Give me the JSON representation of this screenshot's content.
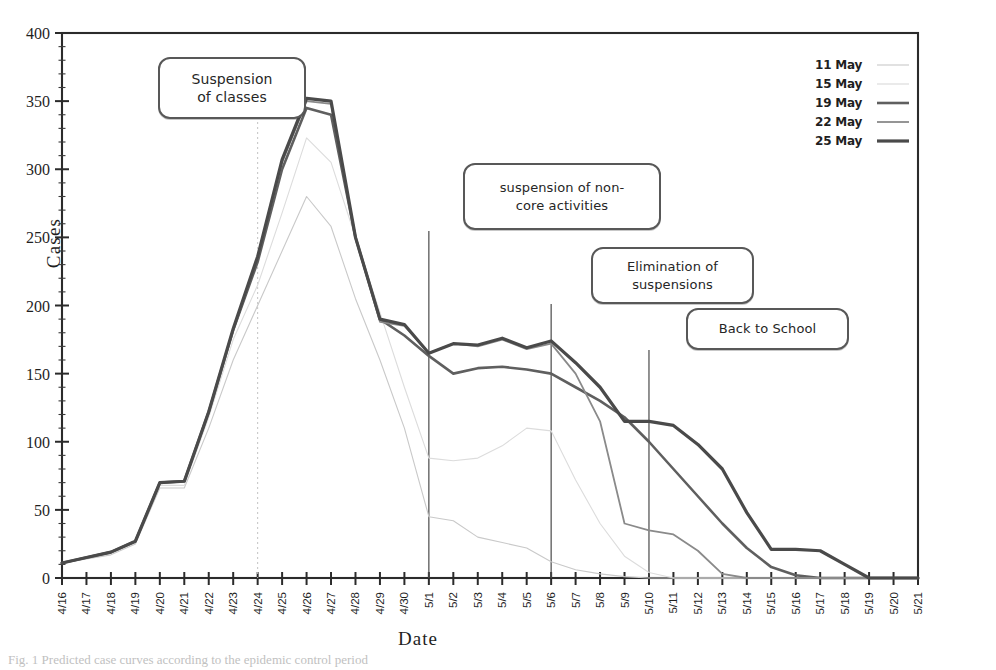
{
  "figure": {
    "caption": "Fig. 1 Predicted case curves according to the epidemic control period"
  },
  "axes": {
    "y_title": "Cases",
    "x_title": "Date"
  },
  "legend": {
    "position": "top-right",
    "entries": [
      {
        "label": "11 May",
        "color": "#c9c9c9",
        "width": 1.1
      },
      {
        "label": "15 May",
        "color": "#d9d9d9",
        "width": 1.1
      },
      {
        "label": "19 May",
        "color": "#5f5f5f",
        "width": 2.6
      },
      {
        "label": "22 May",
        "color": "#8a8a8a",
        "width": 1.8
      },
      {
        "label": "25 May",
        "color": "#4a4a4a",
        "width": 3.2
      }
    ]
  },
  "annotations": [
    {
      "text_line1": "Suspension",
      "text_line2": "of  classes",
      "anchor_date": "4/24"
    },
    {
      "text_line1": "suspension of non-",
      "text_line2": "core activities",
      "anchor_date": "5/1"
    },
    {
      "text_line1": "Elimination of",
      "text_line2": "suspensions",
      "anchor_date": "5/6"
    },
    {
      "text_line1": "Back to School",
      "text_line2": "",
      "anchor_date": "5/10"
    }
  ],
  "chart_data": {
    "type": "line",
    "title": "",
    "xlabel": "Date",
    "ylabel": "Cases",
    "ylim": [
      0,
      400
    ],
    "ytick_step": 50,
    "yticks": [
      0,
      50,
      100,
      150,
      200,
      250,
      300,
      350,
      400
    ],
    "grid": false,
    "legend_position": "top-right",
    "categories": [
      "4/16",
      "4/17",
      "4/18",
      "4/19",
      "4/20",
      "4/21",
      "4/22",
      "4/23",
      "4/24",
      "4/25",
      "4/26",
      "4/27",
      "4/28",
      "4/29",
      "4/30",
      "5/1",
      "5/2",
      "5/3",
      "5/4",
      "5/5",
      "5/6",
      "5/7",
      "5/8",
      "5/9",
      "5/10",
      "5/11",
      "5/12",
      "5/13",
      "5/14",
      "5/15",
      "5/16",
      "5/17",
      "5/18",
      "5/19",
      "5/20",
      "5/21"
    ],
    "series": [
      {
        "name": "11 May",
        "color": "#c9c9c9",
        "width": 1.1,
        "values": [
          11,
          14,
          17,
          25,
          66,
          66,
          110,
          160,
          200,
          240,
          280,
          258,
          205,
          160,
          110,
          45,
          42,
          30,
          26,
          22,
          12,
          6,
          3,
          1,
          0,
          0,
          0,
          0,
          0,
          0,
          0,
          0,
          0,
          0,
          0,
          0
        ]
      },
      {
        "name": "15 May",
        "color": "#dcdcdc",
        "width": 1.1,
        "values": [
          11,
          15,
          18,
          26,
          68,
          68,
          118,
          175,
          215,
          268,
          323,
          305,
          250,
          195,
          140,
          88,
          86,
          88,
          97,
          110,
          108,
          72,
          40,
          16,
          4,
          0,
          0,
          0,
          0,
          0,
          0,
          0,
          0,
          0,
          0,
          0
        ]
      },
      {
        "name": "19 May",
        "color": "#5f5f5f",
        "width": 2.6,
        "values": [
          11,
          15,
          19,
          27,
          70,
          71,
          122,
          182,
          232,
          300,
          345,
          340,
          250,
          190,
          178,
          163,
          150,
          154,
          155,
          153,
          150,
          140,
          130,
          118,
          100,
          80,
          60,
          40,
          22,
          8,
          2,
          0,
          0,
          0,
          0,
          0
        ]
      },
      {
        "name": "22 May",
        "color": "#8a8a8a",
        "width": 1.8,
        "values": [
          11,
          15,
          19,
          27,
          70,
          71,
          122,
          182,
          235,
          305,
          350,
          348,
          250,
          188,
          185,
          165,
          172,
          170,
          175,
          168,
          172,
          150,
          115,
          40,
          35,
          32,
          20,
          3,
          0,
          0,
          0,
          0,
          0,
          0,
          0,
          0
        ]
      },
      {
        "name": "25 May",
        "color": "#4a4a4a",
        "width": 3.2,
        "values": [
          11,
          15,
          19,
          27,
          70,
          71,
          122,
          183,
          236,
          307,
          352,
          350,
          250,
          190,
          186,
          165,
          172,
          171,
          176,
          169,
          174,
          158,
          140,
          115,
          115,
          112,
          98,
          80,
          48,
          21,
          21,
          20,
          10,
          0,
          0,
          0
        ]
      }
    ],
    "event_lines": [
      {
        "label": "Suspension of classes",
        "date": "4/24",
        "style": "dotted"
      },
      {
        "label": "suspension of non-core activities",
        "date": "5/1",
        "style": "solid"
      },
      {
        "label": "Elimination of suspensions",
        "date": "5/6",
        "style": "solid"
      },
      {
        "label": "Back to School",
        "date": "5/10",
        "style": "solid"
      }
    ]
  }
}
